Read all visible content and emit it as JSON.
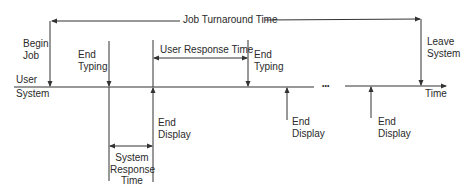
{
  "diagram": {
    "type": "timeline",
    "title_span": {
      "label": "Job Turnaround Time"
    },
    "user_response_span": {
      "label": "User Response Time"
    },
    "system_response_span": {
      "label_line1": "System",
      "label_line2": "Response",
      "label_line3": "Time"
    },
    "axis": {
      "user_label": "User",
      "system_label": "System",
      "time_label": "Time",
      "ellipsis": "•••"
    },
    "events": [
      {
        "id": "begin-job",
        "line1": "Begin",
        "line2": "Job"
      },
      {
        "id": "end-typing-1",
        "line1": "End",
        "line2": "Typing"
      },
      {
        "id": "end-display-1",
        "line1": "End",
        "line2": "Display"
      },
      {
        "id": "end-typing-2",
        "line1": "End",
        "line2": "Typing"
      },
      {
        "id": "end-display-2",
        "line1": "End",
        "line2": "Display"
      },
      {
        "id": "end-display-3",
        "line1": "End",
        "line2": "Display"
      },
      {
        "id": "leave-system",
        "line1": "Leave",
        "line2": "System"
      }
    ],
    "colors": {
      "line": "#333333",
      "text": "#2a2a2a",
      "background": "#ffffff"
    }
  }
}
